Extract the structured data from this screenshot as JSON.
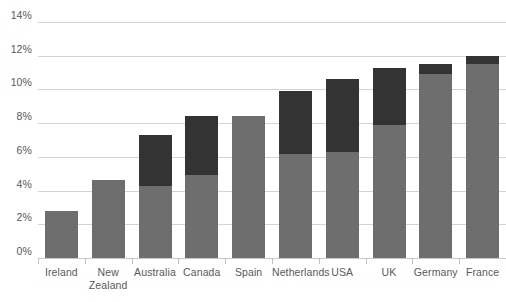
{
  "chart_data": {
    "type": "bar",
    "stacked": true,
    "title": "",
    "subtitle": "",
    "xlabel": "",
    "ylabel": "",
    "ylim": [
      0,
      14
    ],
    "ytick_labels": [
      "0%",
      "2%",
      "4%",
      "6%",
      "8%",
      "10%",
      "12%",
      "14%"
    ],
    "ytick_values": [
      0,
      2,
      4,
      6,
      8,
      10,
      12,
      14
    ],
    "grid": true,
    "legend": "none",
    "categories": [
      "Ireland",
      "New Zealand",
      "Australia",
      "Canada",
      "Spain",
      "Netherlands",
      "USA",
      "UK",
      "Germany",
      "France"
    ],
    "category_lines": [
      [
        "Ireland"
      ],
      [
        "New",
        "Zealand"
      ],
      [
        "Australia"
      ],
      [
        "Canada"
      ],
      [
        "Spain"
      ],
      [
        "Netherlands"
      ],
      [
        "USA"
      ],
      [
        "UK"
      ],
      [
        "Germany"
      ],
      [
        "France"
      ]
    ],
    "series": [
      {
        "name": "lower-segment",
        "color": "#6e6e6e",
        "values": [
          2.8,
          4.6,
          4.3,
          4.9,
          8.4,
          6.2,
          6.3,
          7.9,
          10.9,
          11.5
        ]
      },
      {
        "name": "upper-segment",
        "color": "#333333",
        "values": [
          0.0,
          0.0,
          3.0,
          3.5,
          0.0,
          3.7,
          4.3,
          3.4,
          0.6,
          0.5
        ]
      }
    ],
    "totals": [
      2.8,
      4.6,
      7.3,
      8.4,
      8.4,
      9.9,
      10.6,
      11.3,
      11.5,
      12.0
    ],
    "colors": {
      "lower": "#6e6e6e",
      "upper": "#333333",
      "gridline": "#d4d4d4",
      "axis": "#c8c8c8",
      "text": "#58595b",
      "background": "#ffffff"
    }
  }
}
